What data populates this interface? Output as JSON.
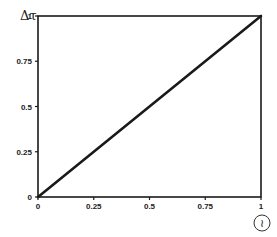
{
  "chart_data": {
    "type": "line",
    "title": "",
    "xlabel": "≀",
    "ylabel": "Δτ",
    "xlim": [
      0,
      1
    ],
    "ylim": [
      0,
      1
    ],
    "grid": false,
    "legend": null,
    "x_ticks": [
      "0",
      "0.25",
      "0.5",
      "0.75",
      "1"
    ],
    "y_ticks": [
      "0",
      "0.25",
      "0.5",
      "0.75",
      "1"
    ],
    "series": [
      {
        "name": "identity",
        "x": [
          0,
          1
        ],
        "y": [
          0,
          1
        ]
      }
    ],
    "box": true
  },
  "colors": {
    "line": "#1a1a1a",
    "axis": "#1a1a1a",
    "background": "#ffffff"
  }
}
